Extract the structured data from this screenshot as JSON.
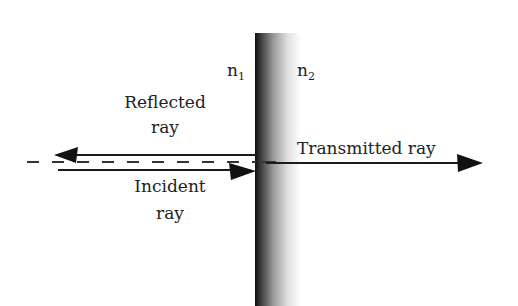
{
  "diagram": {
    "media": {
      "left": {
        "symbol": "n",
        "subscript": "1"
      },
      "right": {
        "symbol": "n",
        "subscript": "2"
      }
    },
    "rays": {
      "reflected": {
        "line1": "Reflected",
        "line2": "ray"
      },
      "incident": {
        "line1": "Incident",
        "line2": "ray"
      },
      "transmitted": {
        "label": "Transmitted ray"
      }
    },
    "colors": {
      "line": "#1a1a1a",
      "interface_dark": "#111111",
      "interface_light": "#ffffff",
      "text": "#222222"
    }
  }
}
